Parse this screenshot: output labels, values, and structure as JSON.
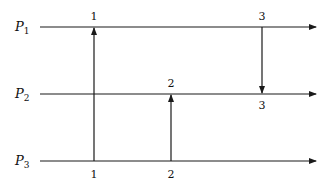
{
  "diagram": {
    "type": "space-time process diagram",
    "processes": [
      {
        "id": "P1",
        "label": "P",
        "subscript": "1",
        "y": 27
      },
      {
        "id": "P2",
        "label": "P",
        "subscript": "2",
        "y": 94
      },
      {
        "id": "P3",
        "label": "P",
        "subscript": "3",
        "y": 161
      }
    ],
    "messages": [
      {
        "id": "m1",
        "from": "P3",
        "to": "P1",
        "x": 94,
        "send_label": "1",
        "receive_label": "1"
      },
      {
        "id": "m2",
        "from": "P3",
        "to": "P2",
        "x": 171,
        "send_label": "2",
        "receive_label": "2"
      },
      {
        "id": "m3",
        "from": "P1",
        "to": "P2",
        "x": 262,
        "send_label": "3",
        "receive_label": "3"
      }
    ],
    "colors": {
      "line": "#1a1a1a",
      "background": "#ffffff"
    }
  }
}
